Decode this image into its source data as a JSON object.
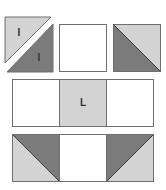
{
  "diagram": {
    "type": "quilt-block-assembly",
    "colors": {
      "light": "#d3d3d3",
      "dark": "#7b7b7b",
      "white": "#ffffff",
      "outline": "#6f6f6f"
    },
    "rows": [
      {
        "name": "top-row",
        "tiles": [
          {
            "kind": "split-hst",
            "labels": [
              "I",
              "I"
            ],
            "light": "upper-left",
            "dark": "lower-right"
          },
          {
            "kind": "plain",
            "fill": "white"
          },
          {
            "kind": "hst",
            "light": "upper-right",
            "dark": "lower-left"
          }
        ]
      },
      {
        "name": "middle-row",
        "tiles": [
          {
            "kind": "plain",
            "fill": "white"
          },
          {
            "kind": "plain",
            "fill": "light",
            "label": "L"
          },
          {
            "kind": "plain",
            "fill": "white"
          }
        ]
      },
      {
        "name": "bottom-row",
        "tiles": [
          {
            "kind": "hst",
            "light": "lower-left",
            "dark": "upper-right"
          },
          {
            "kind": "plain",
            "fill": "white"
          },
          {
            "kind": "hst",
            "light": "lower-right",
            "dark": "upper-left"
          }
        ]
      }
    ],
    "labels": {
      "split_upper": "I",
      "split_lower": "I",
      "center": "L"
    }
  }
}
